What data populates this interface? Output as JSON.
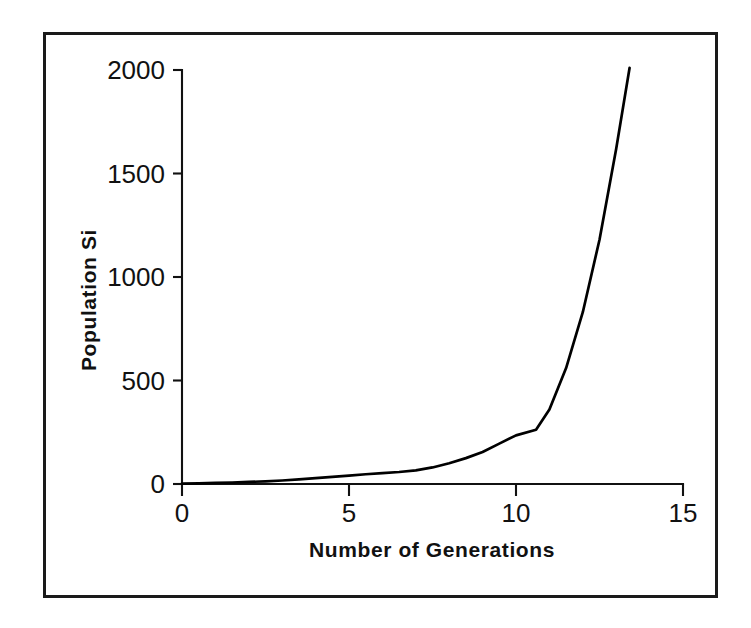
{
  "figure": {
    "background_color": "#ffffff",
    "border_color": "#1a1a1a",
    "line_color": "#000000",
    "text_color": "#111111"
  },
  "chart_data": {
    "type": "line",
    "title": "",
    "xlabel": "Number of Generations",
    "ylabel": "Population Si",
    "xlim": [
      0,
      15
    ],
    "ylim": [
      0,
      2000
    ],
    "xticks": [
      0,
      5,
      10,
      15
    ],
    "yticks": [
      0,
      500,
      1000,
      1500,
      2000
    ],
    "xtick_labels": [
      "0",
      "5",
      "10",
      "15"
    ],
    "ytick_labels": [
      "0",
      "500",
      "1000",
      "1500",
      "2000"
    ],
    "grid": false,
    "legend": false,
    "legend_position": "none",
    "series": [
      {
        "name": "Population Si",
        "x": [
          0.0,
          0.5,
          1.0,
          1.5,
          2.0,
          2.5,
          3.0,
          3.5,
          4.0,
          4.5,
          5.0,
          5.5,
          6.0,
          6.5,
          7.0,
          7.5,
          8.0,
          8.5,
          9.0,
          9.5,
          10.0,
          10.6,
          11.0,
          11.5,
          12.0,
          12.5,
          13.0,
          13.4
        ],
        "y": [
          2,
          3,
          5,
          7,
          10,
          13,
          17,
          22,
          28,
          34,
          40,
          47,
          53,
          58,
          66,
          80,
          100,
          125,
          155,
          195,
          235,
          262,
          360,
          560,
          830,
          1180,
          1620,
          2010
        ]
      }
    ]
  }
}
